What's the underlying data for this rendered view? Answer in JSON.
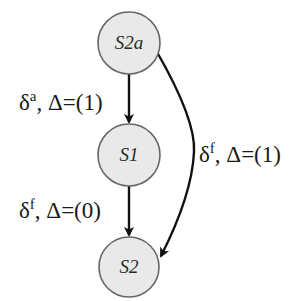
{
  "diagram": {
    "type": "state-transition-graph",
    "nodes": [
      {
        "id": "S2a",
        "label": "S2a"
      },
      {
        "id": "S1",
        "label": "S1"
      },
      {
        "id": "S2",
        "label": "S2"
      }
    ],
    "edges": [
      {
        "from": "S2a",
        "to": "S1",
        "delta": "δ",
        "delta_sup": "a",
        "rest": ", Δ=(1)",
        "label": "δa, Δ=(1)"
      },
      {
        "from": "S1",
        "to": "S2",
        "delta": "δ",
        "delta_sup": "f",
        "rest": ", Δ=(0)",
        "label": "δf, Δ=(0)"
      },
      {
        "from": "S2a",
        "to": "S2",
        "delta": "δ",
        "delta_sup": "f",
        "rest": ", Δ=(1)",
        "label": "δf, Δ=(1)"
      }
    ]
  },
  "colors": {
    "node_fill": "#e9e9e9",
    "node_stroke": "#666666",
    "edge_stroke": "#111111",
    "text": "#1a1a1a"
  }
}
